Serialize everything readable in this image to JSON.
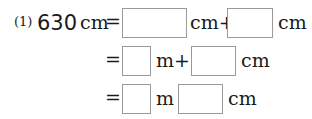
{
  "problem": {
    "label": "(1)",
    "quantity": "630",
    "rows": [
      {
        "eq": "=",
        "unit1": "cm+",
        "unit2": "cm"
      },
      {
        "eq": "=",
        "unit1": "m+",
        "unit2": "cm"
      },
      {
        "eq": "=",
        "unit1": "m",
        "unit2": "cm"
      }
    ],
    "unit": "cm"
  }
}
